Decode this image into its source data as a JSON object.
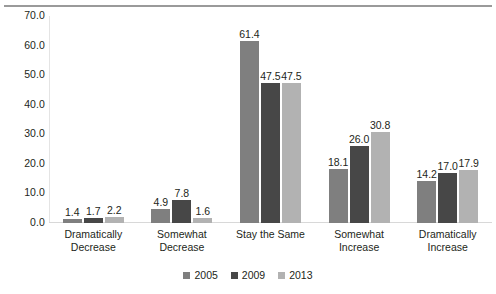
{
  "chart_data": {
    "type": "bar",
    "title": "",
    "subtitle": "",
    "xlabel": "",
    "ylabel": "",
    "ylim": [
      0,
      70
    ],
    "ytick_labels": [
      "0.0",
      "10.0",
      "20.0",
      "30.0",
      "40.0",
      "50.0",
      "60.0",
      "70.0"
    ],
    "ytick_values": [
      0,
      10,
      20,
      30,
      40,
      50,
      60,
      70
    ],
    "grid": false,
    "legend_position": "bottom-center",
    "categories": [
      "Dramatically Decrease",
      "Somewhat Decrease",
      "Stay the Same",
      "Somewhat Increase",
      "Dramatically Increase"
    ],
    "category_lines": [
      [
        "Dramatically",
        "Decrease"
      ],
      [
        "Somewhat",
        "Decrease"
      ],
      [
        "Stay the Same",
        ""
      ],
      [
        "Somewhat",
        "Increase"
      ],
      [
        "Dramatically",
        "Increase"
      ]
    ],
    "series": [
      {
        "name": "2005",
        "color": "#7f7f7f",
        "values": [
          1.4,
          4.9,
          61.4,
          18.1,
          14.2
        ],
        "labels": [
          "1.4",
          "4.9",
          "61.4",
          "18.1",
          "14.2"
        ]
      },
      {
        "name": "2009",
        "color": "#474747",
        "values": [
          1.7,
          7.8,
          47.5,
          26.0,
          17.0
        ],
        "labels": [
          "1.7",
          "7.8",
          "47.5",
          "26.0",
          "17.0"
        ]
      },
      {
        "name": "2013",
        "color": "#b2b2b2",
        "values": [
          2.2,
          1.6,
          47.5,
          30.8,
          17.9
        ],
        "labels": [
          "2.2",
          "1.6",
          "47.5",
          "30.8",
          "17.9"
        ]
      }
    ]
  }
}
